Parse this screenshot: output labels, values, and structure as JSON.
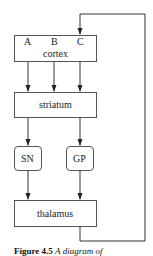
{
  "diagram": {
    "nodes": {
      "cortex": {
        "label": "cortex",
        "inputs": [
          "A",
          "B",
          "C"
        ]
      },
      "striatum": {
        "label": "striatum"
      },
      "sn": {
        "label": "SN"
      },
      "gp": {
        "label": "GP"
      },
      "thalamus": {
        "label": "thalamus"
      }
    },
    "edges": [
      {
        "from": "cortex.A",
        "to": "striatum"
      },
      {
        "from": "cortex.B",
        "to": "striatum"
      },
      {
        "from": "cortex.C",
        "to": "striatum"
      },
      {
        "from": "striatum",
        "to": "SN"
      },
      {
        "from": "striatum",
        "to": "GP"
      },
      {
        "from": "SN",
        "to": "thalamus"
      },
      {
        "from": "GP",
        "to": "thalamus"
      },
      {
        "from": "thalamus",
        "to": "cortex.C",
        "type": "feedback-loop"
      }
    ]
  },
  "caption": {
    "prefix": "Figure 4.5",
    "rest": "A diagram of"
  }
}
